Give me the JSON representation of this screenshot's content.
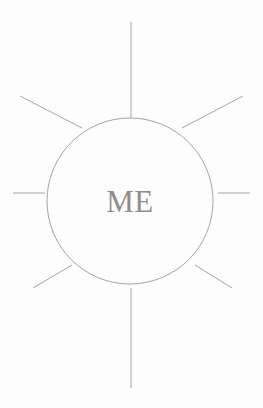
{
  "canvas": {
    "width": 263,
    "height": 408,
    "background_color": "#fdfdfd",
    "title": "ME"
  },
  "diagram": {
    "type": "sunburst-mind-map",
    "stroke_color": "#9a9aa2",
    "stroke_width": 0.9,
    "hub": {
      "label": "ME",
      "label_color": "#8e8e8e",
      "label_font_size": 31,
      "center_x": 130,
      "center_y": 201,
      "radius": 83
    },
    "rays": [
      {
        "name": "ray-north",
        "direction": "N",
        "x1": 131,
        "y1": 22,
        "x2": 131,
        "y2": 118
      },
      {
        "name": "ray-northeast",
        "direction": "NE",
        "x1": 243,
        "y1": 96,
        "x2": 182,
        "y2": 128
      },
      {
        "name": "ray-east",
        "direction": "E",
        "x1": 250,
        "y1": 193,
        "x2": 218,
        "y2": 193
      },
      {
        "name": "ray-southeast",
        "direction": "SE",
        "x1": 232,
        "y1": 288,
        "x2": 195,
        "y2": 265
      },
      {
        "name": "ray-south",
        "direction": "S",
        "x1": 131,
        "y1": 388,
        "x2": 131,
        "y2": 288
      },
      {
        "name": "ray-southwest",
        "direction": "SW",
        "x1": 33,
        "y1": 288,
        "x2": 72,
        "y2": 265
      },
      {
        "name": "ray-west",
        "direction": "W",
        "x1": 13,
        "y1": 193,
        "x2": 45,
        "y2": 193
      },
      {
        "name": "ray-northwest",
        "direction": "NW",
        "x1": 20,
        "y1": 96,
        "x2": 82,
        "y2": 128
      }
    ]
  }
}
